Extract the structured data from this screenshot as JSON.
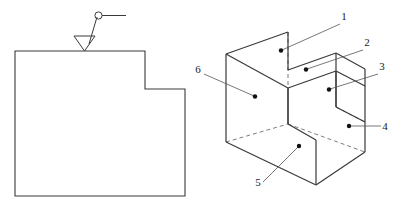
{
  "figure": {
    "line_color": "#3a3a3a",
    "hidden_line_color": "#6e6e6e",
    "leader_color": "#555555",
    "dot_color": "#111111",
    "background": "#ffffff"
  },
  "left_view": {
    "name": "front-orthographic-view",
    "outline_points": "15,51 145,51 145,89 185,89 185,196 15,196",
    "surface_symbol": {
      "name": "surface-finish-symbol",
      "triangle_points": "74,36 95,36 84.5,51",
      "leader_from": "89,44",
      "leader_to": "97,17",
      "circle_cx": 98.5,
      "circle_cy": 15.5,
      "circle_r": 3.6,
      "tail_from": "102,15.5",
      "tail_to": "126,15.5"
    }
  },
  "iso_view": {
    "name": "isometric-stepped-block",
    "solid_edges": [
      "226,54 288,32",
      "288,32 288,70",
      "226,54 226,142",
      "226,54 288,88",
      "288,88 288,124",
      "288,70 336,53",
      "336,53 336,92",
      "288,88 336,71",
      "336,71 336,107",
      "336,53 365,69",
      "365,69 365,152",
      "336,71 365,86",
      "288,124 316,140",
      "316,140 316,185",
      "226,142 316,185",
      "316,185 365,152",
      "288,88 288,124",
      "336,92 336,107",
      "336,107 365,122"
    ],
    "hidden_edges": [
      "288,32 288,88",
      "226,142 288,124",
      "288,124 365,152",
      "336,107 365,122"
    ],
    "callouts": [
      {
        "id": "callout-1",
        "label": "1",
        "label_x": 344,
        "label_y": 20,
        "leader_from": "340,24",
        "leader_to": "282,50",
        "dot_x": 281,
        "dot_y": 50.5
      },
      {
        "id": "callout-2",
        "label": "2",
        "label_x": 367,
        "label_y": 46,
        "leader_from": "363,50",
        "leader_to": "307,69",
        "dot_x": 306,
        "dot_y": 69.5
      },
      {
        "id": "callout-3",
        "label": "3",
        "label_x": 382,
        "label_y": 70,
        "leader_from": "378,74",
        "leader_to": "330,89",
        "dot_x": 329,
        "dot_y": 89.5
      },
      {
        "id": "callout-4",
        "label": "4",
        "label_x": 385,
        "label_y": 130,
        "leader_from": "381,126",
        "leader_to": "350,126",
        "dot_x": 349,
        "dot_y": 126
      },
      {
        "id": "callout-5",
        "label": "5",
        "label_x": 258,
        "label_y": 186,
        "leader_from": "263,182",
        "leader_to": "298,147",
        "dot_x": 299,
        "dot_y": 146
      },
      {
        "id": "callout-6",
        "label": "6",
        "label_x": 198,
        "label_y": 73,
        "leader_from": "204,74",
        "leader_to": "254,96",
        "dot_x": 255,
        "dot_y": 96.5
      }
    ]
  }
}
